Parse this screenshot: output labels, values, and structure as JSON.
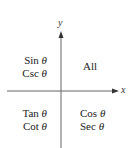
{
  "diagram": {
    "type": "quadrant-sign-diagram",
    "axes": {
      "x_label": "x",
      "y_label": "y",
      "color": "#555555"
    },
    "quadrants": {
      "I": {
        "lines": [
          "All"
        ]
      },
      "II": {
        "lines": [
          {
            "fn": "Sin",
            "var": "θ"
          },
          {
            "fn": "Csc",
            "var": "θ"
          }
        ]
      },
      "III": {
        "lines": [
          {
            "fn": "Tan",
            "var": "θ"
          },
          {
            "fn": "Cot",
            "var": "θ"
          }
        ]
      },
      "IV": {
        "lines": [
          {
            "fn": "Cos",
            "var": "θ"
          },
          {
            "fn": "Sec",
            "var": "θ"
          }
        ]
      }
    }
  }
}
